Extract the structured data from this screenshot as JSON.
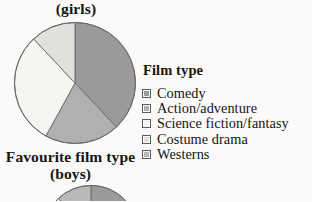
{
  "charts": {
    "girls": {
      "title_line1": "(girls)",
      "caption": "Favourite film type (girls)"
    },
    "boys": {
      "title_line1": "Favourite film type",
      "title_line2": "(boys)"
    }
  },
  "legend": {
    "heading": "Film type",
    "items": [
      {
        "label": "Comedy",
        "color": "#9a9a9a",
        "key": "comedy"
      },
      {
        "label": "Action/adventure",
        "color": "#b0b0b0",
        "key": "action-adventure"
      },
      {
        "label": "Science fiction/fantasy",
        "color": "#f6f5f1",
        "key": "science-fiction-fantasy"
      },
      {
        "label": "Costume drama",
        "color": "#e1e0dc",
        "key": "costume-drama"
      },
      {
        "label": "Westerns",
        "color": "#b9b9b9",
        "key": "westerns"
      }
    ]
  },
  "colors": {
    "background": "#fbfaf8",
    "stroke": "#6a6a6a",
    "text": "#151515"
  },
  "chart_data": [
    {
      "type": "pie",
      "name": "girls",
      "title": "Favourite film type (girls)",
      "labels": [
        "Comedy",
        "Action/adventure",
        "Science fiction/fantasy",
        "Costume drama",
        "Westerns"
      ],
      "values": [
        38,
        20,
        30,
        12,
        0
      ],
      "colors": [
        "#9a9a9a",
        "#b0b0b0",
        "#f6f5f1",
        "#e1e0dc",
        "#b9b9b9"
      ],
      "start_angle_deg": 0,
      "direction": "clockwise",
      "legend_position": "right",
      "units": "percent"
    },
    {
      "type": "pie",
      "name": "boys",
      "title": "Favourite film type (boys)",
      "labels": [
        "Comedy",
        "Action/adventure",
        "Science fiction/fantasy",
        "Costume drama",
        "Westerns"
      ],
      "values": [
        30,
        26,
        22,
        10,
        12
      ],
      "colors": [
        "#9a9a9a",
        "#b0b0b0",
        "#f6f5f1",
        "#e1e0dc",
        "#b9b9b9"
      ],
      "start_angle_deg": 0,
      "direction": "clockwise",
      "legend_position": "right",
      "units": "percent",
      "note": "cropped at bottom of image"
    }
  ]
}
